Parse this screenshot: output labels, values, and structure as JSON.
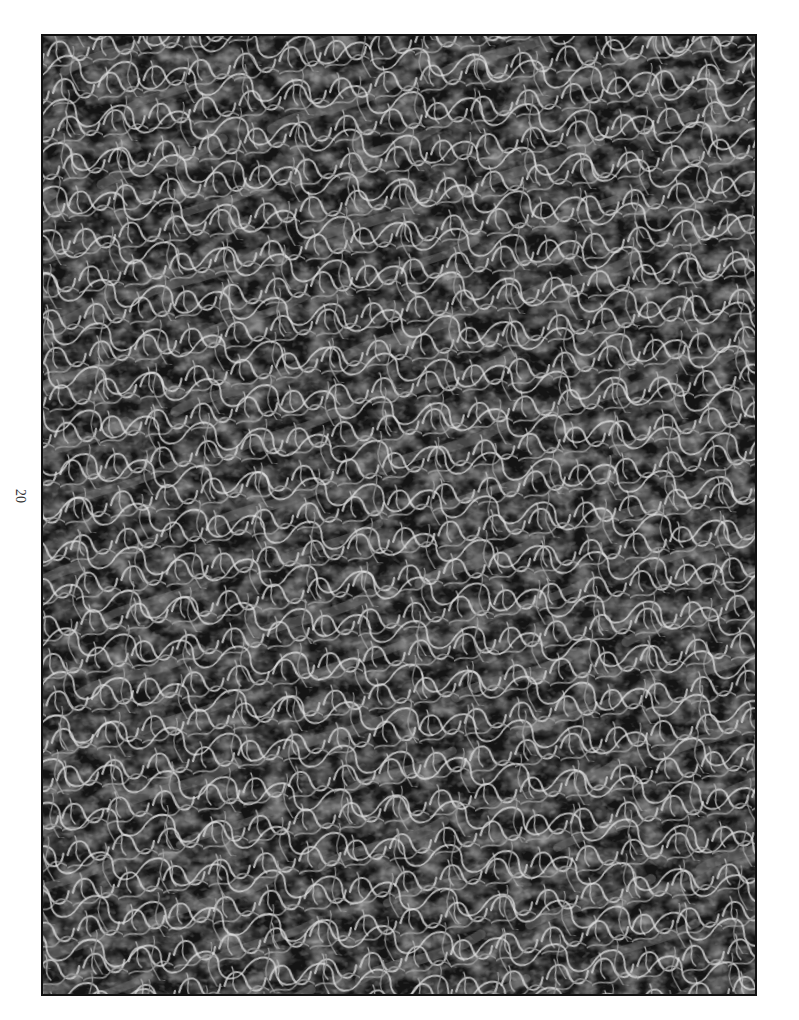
{
  "page": {
    "number": "20",
    "number_orientation": "rotated-90"
  },
  "figure": {
    "kind": "photograph",
    "colors": {
      "background": "#151515",
      "strands": "#d8d8d8",
      "mid": "#7a7a7a",
      "border": "#111111"
    }
  }
}
